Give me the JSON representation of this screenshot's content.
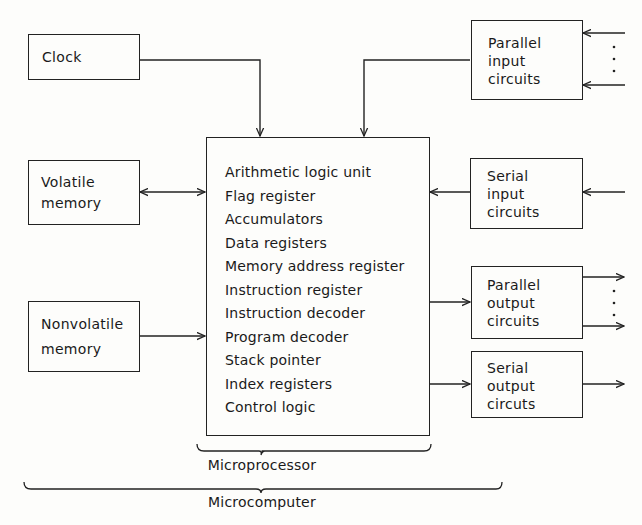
{
  "diagram": {
    "title_hidden": "Microcomputer block diagram",
    "blocks": {
      "clock": {
        "label": "Clock"
      },
      "volatile_memory": {
        "lines": [
          "Volatile",
          "memory"
        ]
      },
      "nonvolatile_memory": {
        "lines": [
          "Nonvolatile",
          "memory"
        ]
      },
      "parallel_input": {
        "lines": [
          "Parallel",
          "input",
          "circuits"
        ]
      },
      "serial_input": {
        "lines": [
          "Serial",
          "input",
          "circuits"
        ]
      },
      "parallel_output": {
        "lines": [
          "Parallel",
          "output",
          "circuits"
        ]
      },
      "serial_output": {
        "lines": [
          "Serial",
          "output",
          "circuts"
        ]
      }
    },
    "microprocessor": {
      "components": [
        "Arithmetic logic unit",
        "Flag register",
        "Accumulators",
        "Data registers",
        "Memory address register",
        "Instruction register",
        "Instruction decoder",
        "Program decoder",
        "Stack pointer",
        "Index registers",
        "Control logic"
      ]
    },
    "braces": {
      "microprocessor_label": "Microprocessor",
      "microcomputer_label": "Microcomputer"
    },
    "connections": [
      {
        "from": "Clock",
        "to": "Microprocessor",
        "direction": "one-way"
      },
      {
        "from": "Parallel input circuits",
        "to": "Microprocessor",
        "direction": "one-way"
      },
      {
        "from": "Volatile memory",
        "to": "Microprocessor",
        "direction": "two-way"
      },
      {
        "from": "Serial input circuits",
        "to": "Microprocessor",
        "direction": "one-way"
      },
      {
        "from": "Nonvolatile memory",
        "to": "Microprocessor",
        "direction": "one-way"
      },
      {
        "from": "Microprocessor",
        "to": "Parallel output circuits",
        "direction": "one-way"
      },
      {
        "from": "Microprocessor",
        "to": "Serial output circuts",
        "direction": "one-way"
      }
    ],
    "colors": {
      "ink": "#1a1a1a",
      "paper": "#fdfdfb"
    }
  }
}
